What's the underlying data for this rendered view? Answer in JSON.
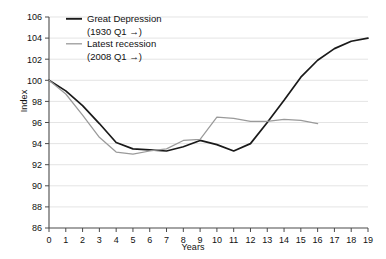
{
  "chart_data": {
    "type": "line",
    "title": "",
    "xlabel": "Years",
    "ylabel": "Index",
    "xlim": [
      0,
      19
    ],
    "ylim": [
      86,
      106
    ],
    "ytick_step": 2,
    "grid": true,
    "legend_position": "top-left",
    "x": [
      0,
      1,
      2,
      3,
      4,
      5,
      6,
      7,
      8,
      9,
      10,
      11,
      12,
      13,
      14,
      15,
      16,
      17,
      18,
      19
    ],
    "xticklabels": [
      "0",
      "1",
      "2",
      "3",
      "4",
      "5",
      "6",
      "7",
      "8",
      "9",
      "10",
      "11",
      "12",
      "13",
      "14",
      "15",
      "16",
      "17",
      "18",
      "19"
    ],
    "yticklabels": [
      "86",
      "88",
      "90",
      "92",
      "94",
      "96",
      "98",
      "100",
      "102",
      "104",
      "106"
    ],
    "series": [
      {
        "name": "Great Depression",
        "note": "(1930 Q1 →)",
        "color": "#1a1a1a",
        "values": [
          100.0,
          99.0,
          97.6,
          95.9,
          94.1,
          93.5,
          93.4,
          93.3,
          93.7,
          94.3,
          93.9,
          93.3,
          94.0,
          96.0,
          98.1,
          100.3,
          101.9,
          103.0,
          103.7,
          104.0
        ]
      },
      {
        "name": "Latest recession",
        "note": "(2008 Q1 →)",
        "color": "#9a9a9a",
        "values": [
          100.0,
          98.7,
          96.7,
          94.6,
          93.2,
          93.0,
          93.3,
          93.5,
          94.3,
          94.4,
          96.5,
          96.4,
          96.1,
          96.1,
          96.3,
          96.2,
          95.9,
          null,
          null,
          null
        ]
      }
    ]
  },
  "legend": {
    "entries": [
      {
        "label": "Great Depression",
        "sub": "(1930 Q1 →)"
      },
      {
        "label": "Latest recession",
        "sub": "(2008 Q1 →)"
      }
    ]
  }
}
